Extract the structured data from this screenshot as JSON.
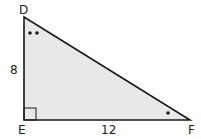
{
  "diagram": {
    "type": "right-triangle",
    "vertices": {
      "D": "D",
      "E": "E",
      "F": "F"
    },
    "sides": {
      "DE": "8",
      "EF": "12"
    },
    "angle_marks": {
      "D": "double-dot",
      "F": "single-dot",
      "E": "right-angle"
    },
    "fill_color": "#e8e8e8",
    "stroke_color": "#1a1a1a"
  }
}
